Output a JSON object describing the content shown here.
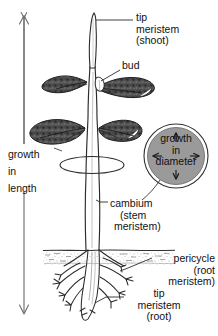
{
  "diagram": {
    "background_color": "#ffffff",
    "ink_color": "#1a1a1a",
    "circle_fill_color": "#9a9a9a",
    "leaf_fill_color": "#4a4a4a"
  },
  "labels": {
    "tip_meristem_shoot": {
      "line1": "tip",
      "line2": "meristem",
      "line3": "(shoot)"
    },
    "bud": {
      "line1": "bud"
    },
    "growth_in_length": {
      "line1": "growth",
      "line2": "in",
      "line3": "length"
    },
    "cambium": {
      "line1": "cambium",
      "line2": "(stem",
      "line3": "meristem)"
    },
    "pericycle": {
      "line1": "pericycle",
      "line2": "(root",
      "line3": "meristem)"
    },
    "tip_meristem_root": {
      "line1": "tip",
      "line2": "meristem",
      "line3": "(root)"
    },
    "growth_in_diameter": {
      "line1": "growth",
      "line2": "in",
      "line3": "diameter"
    }
  },
  "icons": {
    "arrow_up": "up-arrow-icon",
    "arrow_down": "down-arrow-icon",
    "arrow_radial": "radial-arrow-icon"
  }
}
